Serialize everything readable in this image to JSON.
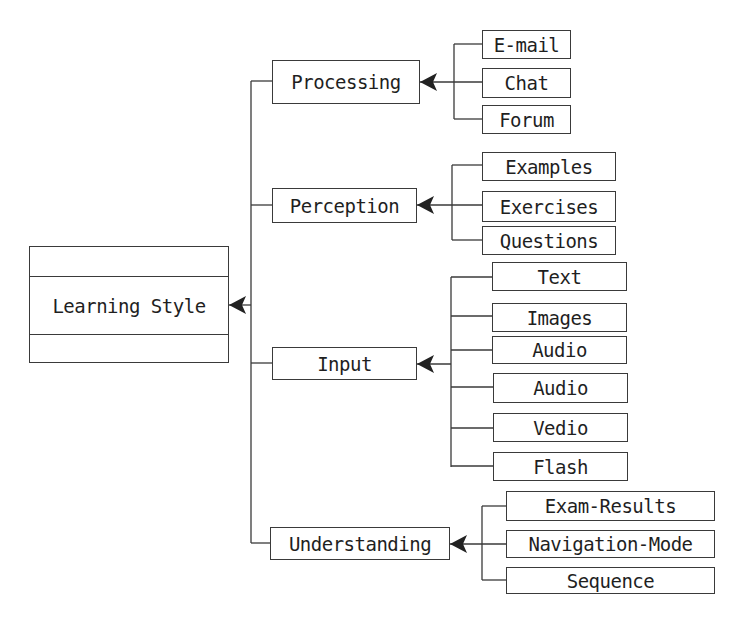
{
  "diagram": {
    "root": {
      "label": "Learning Style"
    },
    "categories": [
      {
        "label": "Processing",
        "children": [
          "E-mail",
          "Chat",
          "Forum"
        ]
      },
      {
        "label": "Perception",
        "children": [
          "Examples",
          "Exercises",
          "Questions"
        ]
      },
      {
        "label": "Input",
        "children": [
          "Text",
          "Images",
          "Audio",
          "Audio",
          "Vedio",
          "Flash"
        ]
      },
      {
        "label": "Understanding",
        "children": [
          "Exam-Results",
          "Navigation-Mode",
          "Sequence"
        ]
      }
    ],
    "colors": {
      "line": "#3a3a3a",
      "text": "#1f1f1f",
      "background": "#ffffff"
    }
  }
}
